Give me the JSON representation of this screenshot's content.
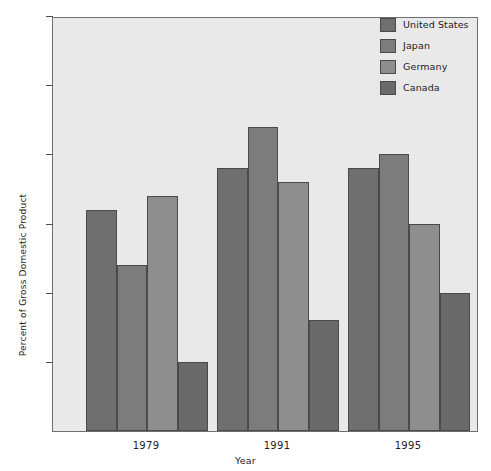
{
  "chart_data": {
    "type": "bar",
    "title": "",
    "xlabel": "Year",
    "ylabel": "Percent of Gross Domestic Product",
    "categories": [
      "1979",
      "1991",
      "1995"
    ],
    "series": [
      {
        "name": "United States",
        "values": [
          1.6,
          1.9,
          1.9
        ],
        "color": "#6f6f6f"
      },
      {
        "name": "Japan",
        "values": [
          1.2,
          2.2,
          2.0
        ],
        "color": "#7c7c7c"
      },
      {
        "name": "Germany",
        "values": [
          1.7,
          1.8,
          1.5
        ],
        "color": "#8e8e8e"
      },
      {
        "name": "Canada",
        "values": [
          0.5,
          0.8,
          1.0
        ],
        "color": "#6a6a6a"
      }
    ],
    "ylim": [
      0,
      3.0
    ],
    "ytick_labels": [
      "0.5",
      "1.0",
      "1.5",
      "2.0",
      "2.5",
      "3.0"
    ],
    "ytick_values": [
      0.5,
      1.0,
      1.5,
      2.0,
      2.5,
      3.0
    ],
    "grid": false,
    "legend_position": "top-right",
    "plot_background": "#e9e9e9",
    "axis_color": "#6f6f6f"
  },
  "legend": {
    "items": [
      {
        "label": "United States"
      },
      {
        "label": "Japan"
      },
      {
        "label": "Germany"
      },
      {
        "label": "Canada"
      }
    ]
  },
  "axes": {
    "y_title": "Percent of Gross Domestic Product",
    "x_title": "Year"
  }
}
